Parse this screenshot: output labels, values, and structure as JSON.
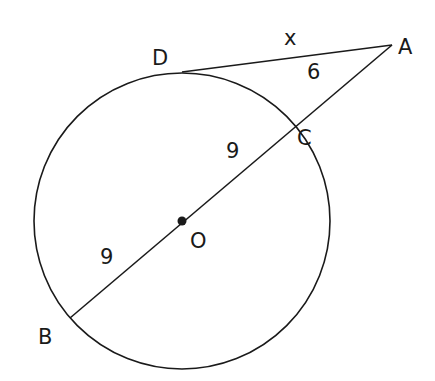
{
  "diagram": {
    "type": "circle-secant-tangent",
    "points": {
      "A": {
        "label": "A",
        "x": 392,
        "y": 45
      },
      "B": {
        "label": "B",
        "x": 70,
        "y": 318
      },
      "C": {
        "label": "C",
        "x": 289,
        "y": 130
      },
      "D": {
        "label": "D",
        "x": 182,
        "y": 72
      },
      "O": {
        "label": "O",
        "x": 182,
        "y": 221
      }
    },
    "circle": {
      "cx": 182,
      "cy": 221,
      "r": 148
    },
    "segment_labels": {
      "DA": "x",
      "AC": "6",
      "OC": "9",
      "BO": "9"
    },
    "colors": {
      "stroke": "#1a1a1a",
      "background": "#ffffff"
    }
  }
}
